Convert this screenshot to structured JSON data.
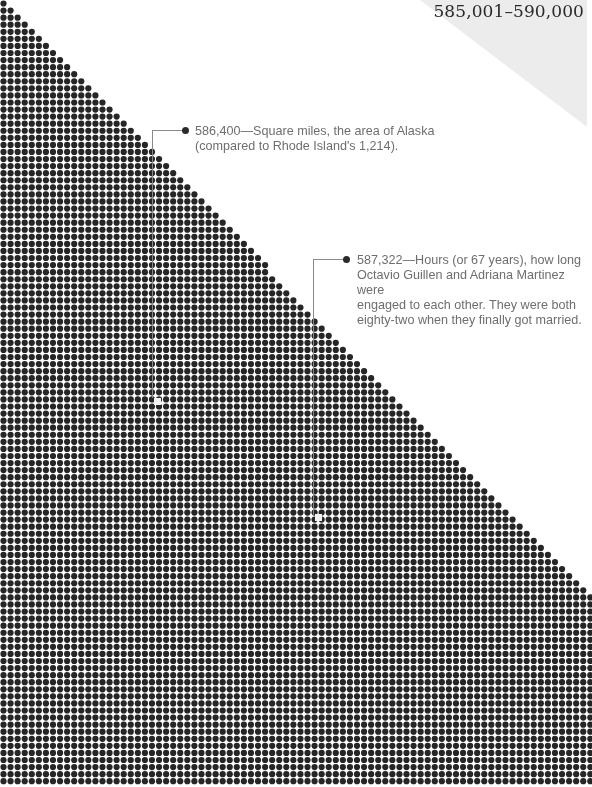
{
  "header": {
    "range_title": "585,001–590,000"
  },
  "colors": {
    "dot": "#262626",
    "background": "#ffffff",
    "gray_triangle": "#ececec",
    "note_text": "#6e6e6e",
    "leader_line": "#8a8a8a"
  },
  "dot_grid": {
    "pitch": 7.07,
    "radius": 3.1,
    "columns": 84,
    "rows": 111,
    "diagonal_edge": "dots present where x <= 0.985 * y (staircase from top-left to right edge)"
  },
  "annotations": [
    {
      "value": "586,400",
      "text": "586,400—Square miles, the area of Alaska\n(compared to Rhode Island's 1,214).",
      "marker": {
        "x": 154,
        "y": 398
      }
    },
    {
      "value": "587,322",
      "text": "587,322—Hours (or 67 years), how long\nOctavio Guillen and Adriana Martinez were\nengaged to each other. They were both\neighty-two when they finally got married.",
      "marker": {
        "x": 315,
        "y": 514
      }
    }
  ]
}
